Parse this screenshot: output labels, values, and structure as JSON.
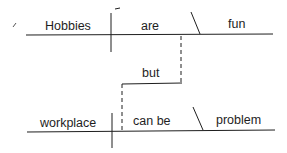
{
  "diagram": {
    "type": "sentence-diagram",
    "clause1": {
      "subject": "Hobbies",
      "verb": "are",
      "complement": "fun"
    },
    "conjunction": "but",
    "clause2": {
      "subject": "workplace",
      "verb": "can be",
      "complement": "problem"
    }
  },
  "colors": {
    "ink": "#1e1e1e",
    "background": "#ffffff"
  }
}
